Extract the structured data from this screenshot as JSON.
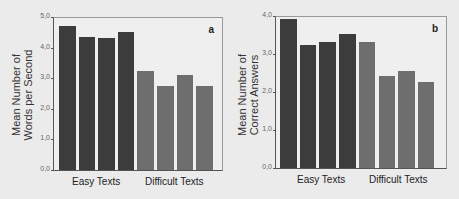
{
  "chart_data": [
    {
      "type": "bar",
      "panel": "a",
      "title": "",
      "xlabel": "",
      "ylabel": "Mean Number of Words per Second",
      "ylabel_lines": [
        "Mean Number of",
        "Words per Second"
      ],
      "ylim": [
        0,
        5
      ],
      "yticks": [
        "0,0",
        "1,0",
        "2,0",
        "3,0",
        "4,0",
        "5,0"
      ],
      "groups": [
        "Easy Texts",
        "Difficult Texts"
      ],
      "categories": [
        "Easy 1",
        "Easy 2",
        "Easy 3",
        "Easy 4",
        "Difficult 1",
        "Difficult 2",
        "Difficult 3",
        "Difficult 4"
      ],
      "values": [
        4.7,
        4.35,
        4.3,
        4.5,
        3.25,
        2.75,
        3.1,
        2.75
      ],
      "colors": {
        "easy": "#3c3c3c",
        "difficult": "#6e6e6e"
      },
      "grid": false,
      "legend": "none"
    },
    {
      "type": "bar",
      "panel": "b",
      "title": "",
      "xlabel": "",
      "ylabel": "Mean Number of Correct Answers",
      "ylabel_lines": [
        "Mean Number of",
        "Correct Answers"
      ],
      "ylim": [
        0,
        4
      ],
      "yticks": [
        "0,0",
        "1,0",
        "2,0",
        "3,0",
        "4,0"
      ],
      "groups": [
        "Easy Texts",
        "Difficult Texts"
      ],
      "categories": [
        "Easy 1",
        "Easy 2",
        "Easy 3",
        "Easy 4",
        "Difficult 1",
        "Difficult 2",
        "Difficult 3",
        "Difficult 4"
      ],
      "values": [
        3.92,
        3.24,
        3.32,
        3.53,
        3.32,
        2.42,
        2.55,
        2.26
      ],
      "colors": {
        "easy": "#3c3c3c",
        "difficult": "#6e6e6e"
      },
      "grid": false,
      "legend": "none"
    }
  ]
}
